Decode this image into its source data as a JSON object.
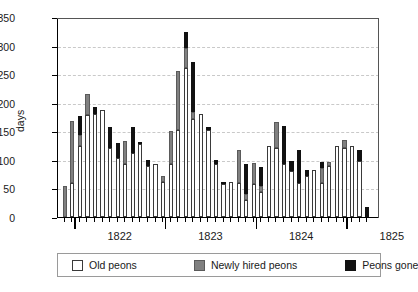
{
  "chart_data": {
    "type": "bar",
    "title": "",
    "subtitle": "",
    "xlabel": "",
    "ylabel": "days",
    "ylim": [
      0,
      350
    ],
    "yticks": [
      0,
      50,
      100,
      150,
      200,
      250,
      300,
      350
    ],
    "grid": "horizontal-dashed",
    "stacked": true,
    "legend_position": "bottom",
    "xtick_labels": [
      "1822",
      "1823",
      "1824",
      "1825"
    ],
    "series": [
      {
        "name": "Old peons",
        "color": "#ffffff"
      },
      {
        "name": "Newly hired peons",
        "color": "#808080"
      },
      {
        "name": "Peons gone",
        "color": "#111111"
      }
    ],
    "categories": [
      "1821-11",
      "1821-12",
      "1822-01",
      "1822-02",
      "1822-03",
      "1822-04",
      "1822-05",
      "1822-06",
      "1822-07",
      "1822-08",
      "1822-09",
      "1822-10",
      "1822-11",
      "1822-12",
      "1823-01",
      "1823-02",
      "1823-03",
      "1823-04",
      "1823-05",
      "1823-06",
      "1823-07",
      "1823-08",
      "1823-09",
      "1823-10",
      "1823-11",
      "1823-12",
      "1824-01",
      "1824-02",
      "1824-03",
      "1824-04",
      "1824-05",
      "1824-06",
      "1824-07",
      "1824-08",
      "1824-09",
      "1824-10",
      "1824-11",
      "1824-12",
      "1825-01",
      "1825-02",
      "1825-03",
      "1825-04",
      "1825-05",
      "1825-06",
      "1825-07",
      "1825-08",
      "1825-09",
      "1825-10",
      "1825-11",
      "1825-12",
      "1826-01"
    ],
    "bars": [
      {
        "old": 0,
        "new": 55,
        "gone": 0
      },
      {
        "old": 60,
        "new": 108,
        "gone": 0
      },
      {
        "old": 124,
        "new": 20,
        "gone": 33
      },
      {
        "old": 178,
        "new": 37,
        "gone": 0
      },
      {
        "old": 180,
        "new": 0,
        "gone": 12
      },
      {
        "old": 187,
        "new": 0,
        "gone": 0
      },
      {
        "old": 120,
        "new": 0,
        "gone": 38
      },
      {
        "old": 104,
        "new": 0,
        "gone": 25
      },
      {
        "old": 93,
        "new": 40,
        "gone": 0
      },
      {
        "old": 112,
        "new": 0,
        "gone": 45
      },
      {
        "old": 127,
        "new": 0,
        "gone": 5
      },
      {
        "old": 90,
        "new": 0,
        "gone": 9
      },
      {
        "old": 93,
        "new": 0,
        "gone": 0
      },
      {
        "old": 62,
        "new": 10,
        "gone": 0
      },
      {
        "old": 92,
        "new": 58,
        "gone": 0
      },
      {
        "old": 153,
        "new": 102,
        "gone": 0
      },
      {
        "old": 261,
        "new": 35,
        "gone": 28
      },
      {
        "old": 172,
        "new": 12,
        "gone": 87
      },
      {
        "old": 180,
        "new": 0,
        "gone": 0
      },
      {
        "old": 153,
        "new": 0,
        "gone": 5
      },
      {
        "old": 93,
        "new": 0,
        "gone": 6
      },
      {
        "old": 57,
        "new": 0,
        "gone": 3
      },
      {
        "old": 62,
        "new": 0,
        "gone": 0
      },
      {
        "old": 60,
        "new": 57,
        "gone": 0
      },
      {
        "old": 30,
        "new": 10,
        "gone": 53
      },
      {
        "old": 58,
        "new": 36,
        "gone": 0
      },
      {
        "old": 43,
        "new": 12,
        "gone": 33
      },
      {
        "old": 125,
        "new": 0,
        "gone": 0
      },
      {
        "old": 120,
        "new": 46,
        "gone": 0
      },
      {
        "old": 93,
        "new": 0,
        "gone": 67
      },
      {
        "old": 80,
        "new": 0,
        "gone": 18
      },
      {
        "old": 60,
        "new": 0,
        "gone": 58
      },
      {
        "old": 72,
        "new": 0,
        "gone": 11
      },
      {
        "old": 83,
        "new": 0,
        "gone": 0
      },
      {
        "old": 60,
        "new": 25,
        "gone": 11
      },
      {
        "old": 90,
        "new": 7,
        "gone": 0
      },
      {
        "old": 125,
        "new": 0,
        "gone": 0
      },
      {
        "old": 121,
        "new": 13,
        "gone": 0
      },
      {
        "old": 125,
        "new": 0,
        "gone": 0
      },
      {
        "old": 98,
        "new": 0,
        "gone": 20
      },
      {
        "old": 0,
        "new": 0,
        "gone": 17
      }
    ]
  },
  "legend": {
    "old_label": "Old peons",
    "new_label": "Newly hired peons",
    "gone_label": "Peons gone"
  }
}
